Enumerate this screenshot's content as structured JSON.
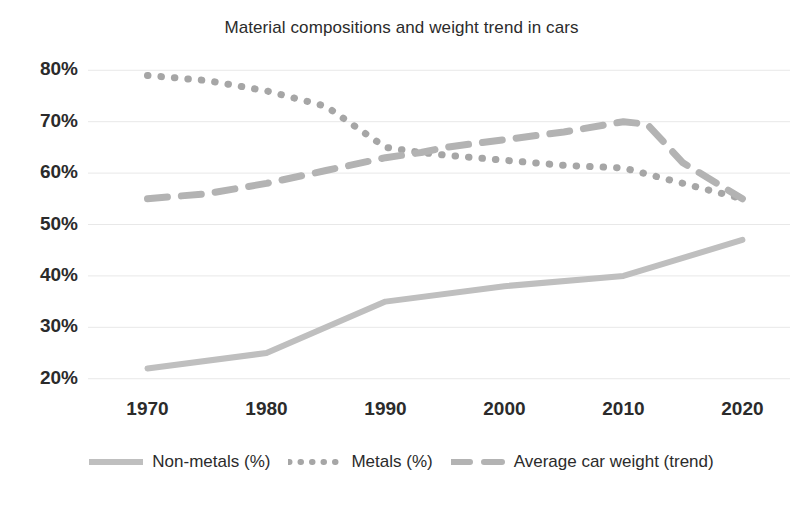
{
  "chart_data": {
    "type": "line",
    "title": "Material compositions and weight trend in cars",
    "xlabel": "",
    "ylabel": "",
    "xlim": [
      1965,
      2024
    ],
    "ylim": [
      0.18,
      0.82
    ],
    "grid": true,
    "legend_position": "bottom",
    "x_tick_labels": [
      "1970",
      "1980",
      "1990",
      "2000",
      "2010",
      "2020"
    ],
    "x_ticks": [
      1970,
      1980,
      1990,
      2000,
      2010,
      2020
    ],
    "y_tick_labels": [
      "80%",
      "70%",
      "60%",
      "50%",
      "40%",
      "30%",
      "20%"
    ],
    "y_ticks": [
      80,
      70,
      60,
      50,
      40,
      30,
      20
    ],
    "series": [
      {
        "name": "Non-metals (%)",
        "style": "solid",
        "color": "#BFBFBF",
        "x": [
          1970,
          1980,
          1990,
          2000,
          2010,
          2020
        ],
        "values": [
          22,
          25,
          35,
          38,
          40,
          47
        ]
      },
      {
        "name": "Metals (%)",
        "style": "dotted",
        "color": "#A6A6A6",
        "x": [
          1970,
          1975,
          1980,
          1985,
          1990,
          1993,
          1995,
          2000,
          2005,
          2010,
          2015,
          2020
        ],
        "values": [
          79,
          78,
          76,
          73,
          65,
          64,
          63.5,
          62.5,
          61.5,
          61,
          58,
          55
        ]
      },
      {
        "name": "Average car weight (trend)",
        "style": "dashed",
        "color": "#B3B3B3",
        "x": [
          1970,
          1975,
          1980,
          1985,
          1990,
          1993,
          1995,
          2000,
          2005,
          2010,
          2012,
          2015,
          2020
        ],
        "values": [
          55,
          56,
          58,
          60.5,
          63,
          64,
          65,
          66.5,
          68,
          70,
          69.5,
          62,
          55
        ]
      }
    ]
  },
  "legend": [
    {
      "label": "Non-metals (%)",
      "icon": "solid-line-swatch"
    },
    {
      "label": "Metals (%)",
      "icon": "dotted-line-swatch"
    },
    {
      "label": "Average car weight (trend)",
      "icon": "dashed-line-swatch"
    }
  ],
  "colors": {
    "grid": "#E8E8E8",
    "text": "#2b2b2b",
    "background": "#ffffff",
    "non_metals": "#BFBFBF",
    "metals": "#A6A6A6",
    "weight_trend": "#B3B3B3"
  }
}
